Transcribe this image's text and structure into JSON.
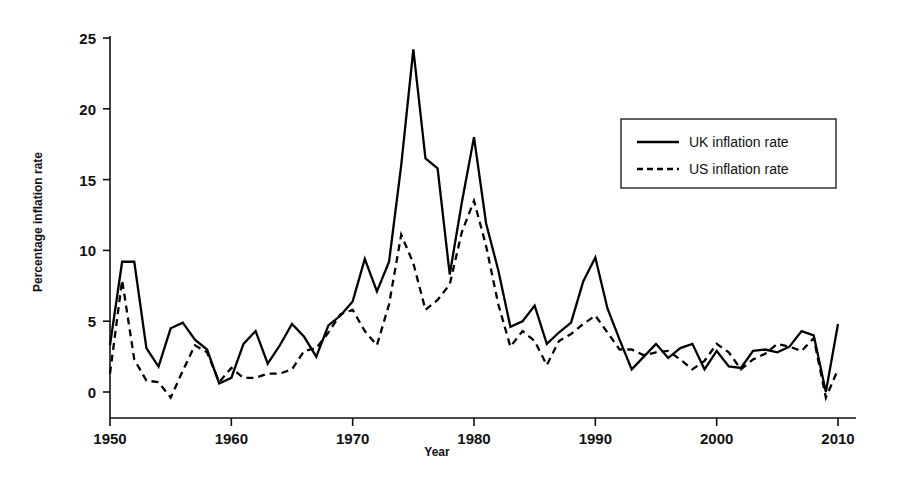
{
  "chart_data": {
    "type": "line",
    "title": "",
    "xlabel": "Year",
    "ylabel": "Percentage inflation rate",
    "xlim": [
      1950,
      2010
    ],
    "ylim": [
      -1.5,
      25
    ],
    "grid": false,
    "legend_position": "upper-right",
    "xticks": [
      1950,
      1960,
      1970,
      1980,
      1990,
      2000,
      2010
    ],
    "xtick_labels": [
      "1950",
      "1960",
      "1970",
      "1980",
      "1990",
      "2000",
      "2010"
    ],
    "yticks": [
      0,
      5,
      10,
      15,
      20,
      25
    ],
    "ytick_labels": [
      "0",
      "5",
      "10",
      "15",
      "20",
      "25"
    ],
    "x": [
      1950,
      1951,
      1952,
      1953,
      1954,
      1955,
      1956,
      1957,
      1958,
      1959,
      1960,
      1961,
      1962,
      1963,
      1964,
      1965,
      1966,
      1967,
      1968,
      1969,
      1970,
      1971,
      1972,
      1973,
      1974,
      1975,
      1976,
      1977,
      1978,
      1979,
      1980,
      1981,
      1982,
      1983,
      1984,
      1985,
      1986,
      1987,
      1988,
      1989,
      1990,
      1991,
      1992,
      1993,
      1994,
      1995,
      1996,
      1997,
      1998,
      1999,
      2000,
      2001,
      2002,
      2003,
      2004,
      2005,
      2006,
      2007,
      2008,
      2009,
      2010
    ],
    "series": [
      {
        "name": "UK inflation rate",
        "style": "solid",
        "color": "#000000",
        "values": [
          3.3,
          9.2,
          9.2,
          3.1,
          1.8,
          4.5,
          4.9,
          3.7,
          3.0,
          0.6,
          1.0,
          3.4,
          4.3,
          2.0,
          3.3,
          4.8,
          3.9,
          2.5,
          4.7,
          5.4,
          6.4,
          9.4,
          7.1,
          9.2,
          16.0,
          24.2,
          16.5,
          15.8,
          8.3,
          13.4,
          18.0,
          11.9,
          8.6,
          4.6,
          5.0,
          6.1,
          3.4,
          4.2,
          4.9,
          7.8,
          9.5,
          5.9,
          3.7,
          1.6,
          2.5,
          3.4,
          2.4,
          3.1,
          3.4,
          1.6,
          2.9,
          1.8,
          1.7,
          2.9,
          3.0,
          2.8,
          3.2,
          4.3,
          4.0,
          0.0,
          4.8
        ]
      },
      {
        "name": "US inflation rate",
        "style": "dashed",
        "color": "#000000",
        "values": [
          1.3,
          7.9,
          2.3,
          0.8,
          0.7,
          -0.4,
          1.5,
          3.3,
          2.8,
          0.7,
          1.7,
          1.0,
          1.0,
          1.3,
          1.3,
          1.6,
          2.9,
          3.1,
          4.2,
          5.5,
          5.8,
          4.3,
          3.3,
          6.2,
          11.1,
          9.1,
          5.8,
          6.5,
          7.6,
          11.3,
          13.5,
          10.3,
          6.2,
          3.2,
          4.3,
          3.6,
          1.9,
          3.6,
          4.1,
          4.8,
          5.4,
          4.2,
          3.0,
          3.0,
          2.6,
          2.8,
          2.9,
          2.3,
          1.6,
          2.2,
          3.4,
          2.8,
          1.6,
          2.3,
          2.7,
          3.4,
          3.2,
          2.9,
          3.8,
          -0.4,
          1.6
        ]
      }
    ]
  },
  "axes": {
    "ylabel": "Percentage inflation rate",
    "xlabel": "Year",
    "ytick_labels": [
      "0",
      "5",
      "10",
      "15",
      "20",
      "25"
    ],
    "xtick_labels": [
      "1950",
      "1960",
      "1970",
      "1980",
      "1990",
      "2000",
      "2010"
    ]
  },
  "legend": {
    "entries": [
      {
        "label": "UK inflation rate",
        "style": "solid"
      },
      {
        "label": "US inflation rate",
        "style": "dashed"
      }
    ]
  }
}
